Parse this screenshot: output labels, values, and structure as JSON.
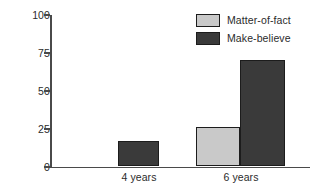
{
  "chart_data": {
    "type": "bar",
    "title": "",
    "subtitle": "",
    "xlabel": "",
    "ylabel": "",
    "categories": [
      "4 years",
      "6 years"
    ],
    "series": [
      {
        "name": "Matter-of-fact",
        "values": [
          0,
          26
        ],
        "color": "#c9c9c9"
      },
      {
        "name": "Make-believe",
        "values": [
          17,
          70
        ],
        "color": "#3a3a3a"
      }
    ],
    "ylim": [
      0,
      100
    ],
    "yticks": [
      "0",
      "25",
      "50",
      "75",
      "100"
    ],
    "grid": false,
    "legend_position": "top-right",
    "annotations": []
  },
  "legend": {
    "entries": [
      {
        "label": "Matter-of-fact",
        "color": "#c9c9c9"
      },
      {
        "label": "Make-believe",
        "color": "#3a3a3a"
      }
    ]
  },
  "axes": {
    "y_tick_labels": [
      "100",
      "75",
      "50",
      "25",
      "0"
    ],
    "x_tick_labels": [
      "4 years",
      "6 years"
    ]
  }
}
